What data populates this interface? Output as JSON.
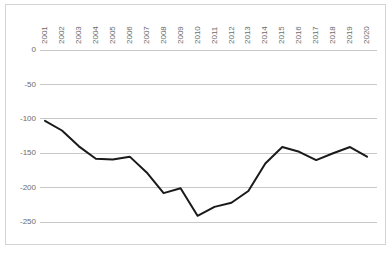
{
  "chart_data": {
    "type": "line",
    "title": "",
    "subtitle": "",
    "xlabel": "",
    "ylabel": "",
    "categories": [
      "2001",
      "2002",
      "2003",
      "2004",
      "2005",
      "2006",
      "2007",
      "2008",
      "2009",
      "2010",
      "2011",
      "2012",
      "2013",
      "2014",
      "2015",
      "2016",
      "2017",
      "2018",
      "2019",
      "2020"
    ],
    "values": [
      -103,
      -117,
      -140,
      -158,
      -159,
      -155,
      -178,
      -208,
      -201,
      -241,
      -228,
      -222,
      -205,
      -165,
      -141,
      -148,
      -160,
      -150,
      -141,
      -155
    ],
    "series": [
      {
        "name": "series-1",
        "values": [
          -103,
          -117,
          -140,
          -158,
          -159,
          -155,
          -178,
          -208,
          -201,
          -241,
          -228,
          -222,
          -205,
          -165,
          -141,
          -148,
          -160,
          -150,
          -141,
          -155
        ],
        "color": "#1a1a1a"
      }
    ],
    "ylim": [
      -275,
      10
    ],
    "ytick_labels": [
      "0",
      "-50",
      "-100",
      "-150",
      "-200",
      "-250"
    ],
    "ytick_values": [
      0,
      -50,
      -100,
      -150,
      -200,
      -250
    ],
    "xtick_labels": [
      "2001",
      "2002",
      "2003",
      "2004",
      "2005",
      "2006",
      "2007",
      "2008",
      "2009",
      "2010",
      "2011",
      "2012",
      "2013",
      "2014",
      "2015",
      "2016",
      "2017",
      "2018",
      "2019",
      "2020"
    ],
    "xtick_rotation": -90,
    "grid": true,
    "grid_axis": "y",
    "legend": false,
    "legend_position": "none",
    "grid_color": "#c8c8c8",
    "border_color": "#d4d4d4",
    "tick_label_color": "#6b6b6b",
    "background_color": "#ffffff"
  }
}
